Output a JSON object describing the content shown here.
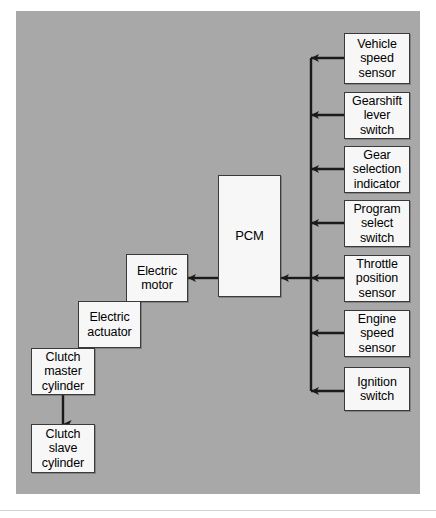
{
  "diagram": {
    "panel_color": "#a8a8a8",
    "box_fill": "#f7f7f7",
    "box_border": "#3a3a3a",
    "line_color": "#1a1a1a",
    "nodes": {
      "pcm": "PCM",
      "electric_motor": "Electric\nmotor",
      "electric_actuator": "Electric\nactuator",
      "clutch_master_cylinder": "Clutch\nmaster\ncylinder",
      "clutch_slave_cylinder": "Clutch\nslave\ncylinder",
      "vehicle_speed_sensor": "Vehicle\nspeed\nsensor",
      "gearshift_lever_switch": "Gearshift\nlever\nswitch",
      "gear_selection_indicator": "Gear\nselection\nindicator",
      "program_select_switch": "Program\nselect\nswitch",
      "throttle_position_sensor": "Throttle\nposition\nsensor",
      "engine_speed_sensor": "Engine\nspeed\nsensor",
      "ignition_switch": "Ignition\nswitch"
    },
    "connections": [
      {
        "from": "vehicle_speed_sensor",
        "to": "input_bus",
        "direction": "left"
      },
      {
        "from": "gearshift_lever_switch",
        "to": "input_bus",
        "direction": "left"
      },
      {
        "from": "gear_selection_indicator",
        "to": "input_bus",
        "direction": "left"
      },
      {
        "from": "program_select_switch",
        "to": "input_bus",
        "direction": "left"
      },
      {
        "from": "throttle_position_sensor",
        "to": "pcm",
        "direction": "left"
      },
      {
        "from": "engine_speed_sensor",
        "to": "input_bus",
        "direction": "left"
      },
      {
        "from": "ignition_switch",
        "to": "input_bus",
        "direction": "left"
      },
      {
        "from": "input_bus",
        "to": "pcm",
        "direction": "left"
      },
      {
        "from": "pcm",
        "to": "electric_motor",
        "direction": "left"
      },
      {
        "from": "clutch_master_cylinder",
        "to": "clutch_slave_cylinder",
        "direction": "down"
      }
    ]
  }
}
